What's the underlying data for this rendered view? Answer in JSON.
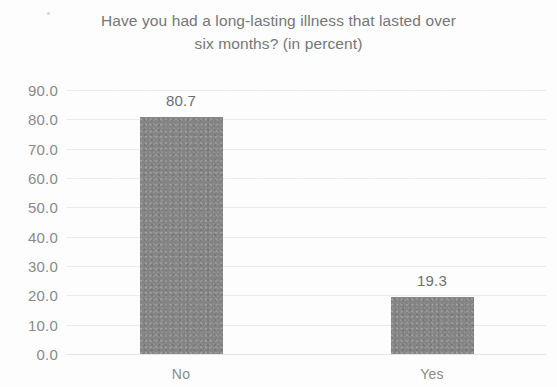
{
  "chart_data": {
    "type": "bar",
    "title": "Have you had a long-lasting illness that lasted over\nsix months? (in percent)",
    "title_line1": "Have you had a long-lasting illness that lasted over",
    "title_line2": "six months? (in percent)",
    "categories": [
      "No",
      "Yes"
    ],
    "values": [
      80.7,
      19.3
    ],
    "data_labels": [
      "80.7",
      "19.3"
    ],
    "xlabel": "",
    "ylabel": "",
    "ylim": [
      0.0,
      90.0
    ],
    "y_ticks": [
      90.0,
      80.0,
      70.0,
      60.0,
      50.0,
      40.0,
      30.0,
      20.0,
      10.0,
      0.0
    ],
    "y_tick_labels": [
      "90.0",
      "80.0",
      "70.0",
      "60.0",
      "50.0",
      "40.0",
      "30.0",
      "20.0",
      "10.0",
      "0.0"
    ],
    "grid": true,
    "grid_axis": "y",
    "legend": null,
    "legend_position": "none",
    "series": [
      {
        "name": "Percent",
        "values": [
          80.7,
          19.3
        ],
        "color": "#848484"
      }
    ],
    "colors": {
      "bar": "#848484",
      "gridline": "#ebebeb",
      "title_text": "#767676",
      "tick_text": "#8a8a8a",
      "label_text": "#6f6f6f",
      "background": "#fdfdfd"
    }
  }
}
